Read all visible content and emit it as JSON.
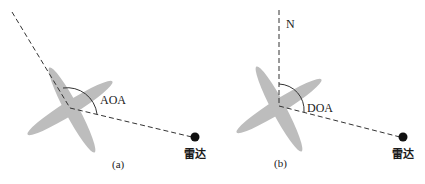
{
  "panels": [
    {
      "id": "a",
      "caption": "(a)",
      "angle_label": "AOA",
      "radar_label": "雷达",
      "reference": "aircraft heading"
    },
    {
      "id": "b",
      "caption": "(b)",
      "angle_label": "DOA",
      "radar_label": "雷达",
      "reference_label": "N"
    }
  ],
  "colors": {
    "aircraft_fill": "#bdbdbd",
    "line": "#333333",
    "radar_dot": "#111111"
  }
}
